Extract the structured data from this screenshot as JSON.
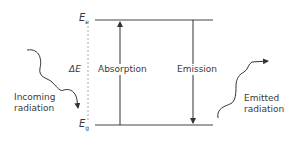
{
  "diagram": {
    "levels": {
      "excited": {
        "symbol": "E",
        "subscript": "e"
      },
      "ground": {
        "symbol": "E",
        "subscript": "g"
      }
    },
    "gap_label": "ΔE",
    "transitions": {
      "absorption": "Absorption",
      "emission": "Emission"
    },
    "incoming": {
      "line1": "Incoming",
      "line2": "radiation"
    },
    "emitted": {
      "line1": "Emitted",
      "line2": "radiation"
    },
    "colors": {
      "line": "#333333",
      "dotted": "#aaaaaa",
      "text": "#3a3a3a"
    }
  }
}
